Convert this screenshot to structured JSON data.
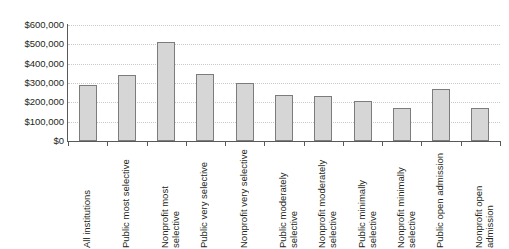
{
  "chart_data": {
    "type": "bar",
    "title": "",
    "subtitle": "",
    "xlabel": "",
    "ylabel": "",
    "ylim": [
      0,
      600000
    ],
    "ytick_step": 100000,
    "grid": true,
    "legend": "none",
    "orientation": "vertical",
    "bar_fill_color": "#d6d6d6",
    "bar_border_color": "#7c7c7c",
    "gridline_color": "#c9c9c9",
    "axis_color": "#58595b",
    "background_color": "#ffffff",
    "y_tick_labels": [
      "$600,000",
      "$500,000",
      "$400,000",
      "$300,000",
      "$200,000",
      "$100,000",
      "$0"
    ],
    "y_tick_values": [
      600000,
      500000,
      400000,
      300000,
      200000,
      100000,
      0
    ],
    "categories": [
      "All institutions",
      "Public most selective",
      "Nonprofit most selective",
      "Public very selective",
      "Nonprofit very selective",
      "Public moderately selective",
      "Nonprofit moderately selective",
      "Public minimally selective",
      "Nonprofit minimally selective",
      "Public open admission",
      "Nonprofit open admission"
    ],
    "values": [
      290000,
      340000,
      512000,
      345000,
      298000,
      240000,
      233000,
      207000,
      172000,
      270000,
      173000
    ]
  }
}
